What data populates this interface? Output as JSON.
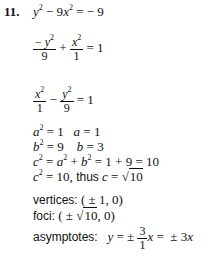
{
  "problem": {
    "number": "11.",
    "equation": "y² − 9x² = −9",
    "step_standard_form": "−y²/9 + x²/1 = 1",
    "step_rearranged": "x²/1 − y²/9 = 1",
    "a_line": "a² = 1   a = 1",
    "b_line": "b² = 9   b = 3",
    "c_line": "c² = a² + b² = 1 + 9 = 10",
    "c_result": "c² = 10, thus c = √10",
    "vertices_label": "vertices:",
    "vertices_value": "(±1, 0)",
    "foci_label": "foci:",
    "foci_value": "(±√10, 0)",
    "asymptotes_label": "asymptotes:",
    "asymptotes_value": "y = ±(3/1)x = ±3x"
  }
}
